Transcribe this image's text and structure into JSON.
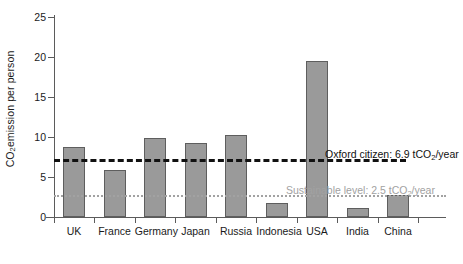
{
  "chart_data": {
    "type": "bar",
    "title": "",
    "subtitle": "",
    "xlabel": "",
    "ylabel": "CO2 emission per person",
    "ylabel_parts": {
      "pre": "CO",
      "sub": "2",
      "post": " emission per person"
    },
    "categories": [
      "UK",
      "France",
      "Germany",
      "Japan",
      "Russia",
      "Indonesia",
      "USA",
      "India",
      "China"
    ],
    "values": [
      8.8,
      5.9,
      9.9,
      9.2,
      10.2,
      1.7,
      19.5,
      1.1,
      2.8
    ],
    "series": [
      {
        "name": "CO2 emission per person",
        "values": [
          8.8,
          5.9,
          9.9,
          9.2,
          10.2,
          1.7,
          19.5,
          1.1,
          2.8
        ]
      }
    ],
    "ylim": [
      0,
      25
    ],
    "yticks": [
      0,
      5,
      10,
      15,
      20,
      25
    ],
    "ytick_labels": [
      "0",
      "5",
      "10",
      "15",
      "20",
      "25"
    ],
    "grid": false,
    "legend": "none",
    "bar_color": "#9a9a9a",
    "bar_edge_color": "#5e5e5e",
    "axis_color": "#5b5b5b",
    "annotations": [
      {
        "id": "oxford",
        "value": 6.9,
        "text": "Oxford citizen: 6.9 tCO2/year",
        "text_parts": {
          "pre": "Oxford citizen: 6.9 tCO",
          "sub": "2",
          "post": "/year"
        },
        "line_style": "dashed",
        "color": "#111111"
      },
      {
        "id": "sustainable",
        "value": 2.5,
        "text": "Sustainable level: 2.5 tCO2/year",
        "text_parts": {
          "pre": "Sustainable level: 2.5 tCO",
          "sub": "2",
          "post": "/year"
        },
        "line_style": "dotted",
        "color": "#a2a2a2"
      }
    ]
  }
}
